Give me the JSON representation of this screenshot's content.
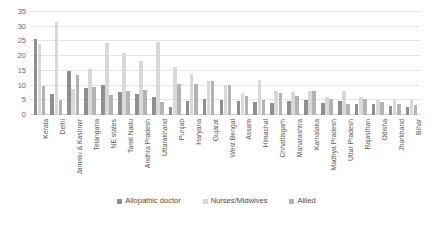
{
  "chart_data": {
    "type": "bar",
    "title": "",
    "subtitle": "",
    "xlabel": "",
    "ylabel": "",
    "ylim": [
      0,
      35
    ],
    "yticks": [
      0,
      5,
      10,
      15,
      20,
      25,
      30,
      35
    ],
    "grid": true,
    "legend_position": "bottom",
    "categories": [
      "Kerala",
      "Delhi",
      "Jammu & Kashmir",
      "Telangana",
      "NE states",
      "Tamil Nadu",
      "Andhra Pradesh",
      "Uttarakhand",
      "Punjab",
      "Haryana",
      "Gujarat",
      "West Bengal",
      "Assam",
      "Himachal",
      "Chhattisgarh",
      "Maharashtra",
      "Karnataka",
      "Madhya Pradesh",
      "Uttar Pradesh",
      "Rajasthan",
      "Odisha",
      "Jharkhand",
      "Bihar"
    ],
    "series": [
      {
        "name": "Allopathic doctor",
        "color": "#8f8f8f",
        "values": [
          26.0,
          7.0,
          14.8,
          9.2,
          10.2,
          7.8,
          7.3,
          6.0,
          2.8,
          4.7,
          5.5,
          5.2,
          4.8,
          4.5,
          4.2,
          4.6,
          5.2,
          4.0,
          4.8,
          3.9,
          3.6,
          3.2,
          2.8
        ]
      },
      {
        "name": "Nurses/Midwives",
        "color": "#d9d9d9",
        "values": [
          24.0,
          31.5,
          9.0,
          15.8,
          24.4,
          21.0,
          18.5,
          24.8,
          16.2,
          13.8,
          11.6,
          10.2,
          7.4,
          12.0,
          8.2,
          7.8,
          8.0,
          6.0,
          8.2,
          6.0,
          5.0,
          5.4,
          5.0
        ]
      },
      {
        "name": "Allied",
        "color": "#b3b3b3",
        "values": [
          9.8,
          5.0,
          13.6,
          9.6,
          6.7,
          8.0,
          8.6,
          4.4,
          10.4,
          10.6,
          11.4,
          10.2,
          6.6,
          5.2,
          7.6,
          6.4,
          8.2,
          5.4,
          3.6,
          5.6,
          4.4,
          3.6,
          3.4
        ]
      }
    ]
  },
  "legend": {
    "items": [
      {
        "label": "Allopathic doctor",
        "color": "#8f8f8f"
      },
      {
        "label": "Nurses/Midwives",
        "color": "#d9d9d9"
      },
      {
        "label": "Allied",
        "color": "#b3b3b3"
      }
    ]
  }
}
